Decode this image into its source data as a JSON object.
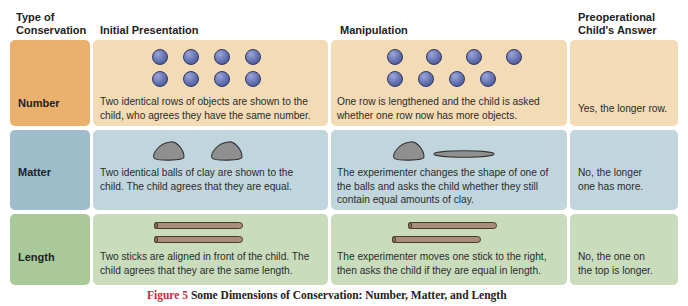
{
  "headers": {
    "type_line1": "Type of",
    "type_line2": "Conservation",
    "initial": "Initial Presentation",
    "manipulation": "Manipulation",
    "answer_line1": "Preoperational",
    "answer_line2": "Child's Answer"
  },
  "rows": [
    {
      "type": "Number",
      "initial_line1": "Two identical rows of objects are shown to the",
      "initial_line2": "child, who agrees they have the same number.",
      "manipulation_line1": "One row is lengthened and the child is asked",
      "manipulation_line2": "whether one row now has more objects.",
      "answer_line1": "Yes, the longer row.",
      "colors": {
        "label": "#e9b06e",
        "cell": "#f3dcb5"
      }
    },
    {
      "type": "Matter",
      "initial_line1": "Two identical balls of clay are shown to the",
      "initial_line2": "child. The child agrees that they are equal.",
      "manipulation_line1": "The experimenter changes the shape of one of",
      "manipulation_line2": "the balls and asks the child whether they still",
      "manipulation_line3": "contain equal amounts of clay.",
      "answer_line1": "No, the longer",
      "answer_line2": "one has more.",
      "colors": {
        "label": "#9fbccb",
        "cell": "#c0d6dc"
      }
    },
    {
      "type": "Length",
      "initial_line1": "Two sticks are aligned in front of the child. The",
      "initial_line2": "child agrees that they are the same length.",
      "manipulation_line1": "The experimenter moves one stick to the right,",
      "manipulation_line2": "then asks the child if they are equal in length.",
      "answer_line1": "No, the one on",
      "answer_line2": "the top is longer.",
      "colors": {
        "label": "#a9c99a",
        "cell": "#c9ddbd"
      }
    }
  ],
  "caption": {
    "figure_label": "Figure 5",
    "title": "Some Dimensions of Conservation: Number, Matter, and Length"
  }
}
